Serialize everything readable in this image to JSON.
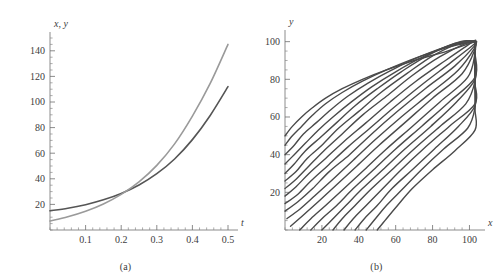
{
  "figure": {
    "panels": [
      {
        "caption": "(a)",
        "ylabel": "x, y",
        "xlabel": "t",
        "xticks": [
          "0.1",
          "0.2",
          "0.3",
          "0.4",
          "0.5"
        ],
        "yticks": [
          "20",
          "40",
          "60",
          "80",
          "100",
          "120",
          "140"
        ]
      },
      {
        "caption": "(b)",
        "ylabel": "y",
        "xlabel": "x",
        "xticks": [
          "20",
          "40",
          "60",
          "80",
          "100"
        ],
        "yticks": [
          "20",
          "40",
          "60",
          "80",
          "100"
        ]
      }
    ]
  },
  "chart_data": [
    {
      "type": "line",
      "panel": "(a)",
      "title": "",
      "xlabel": "t",
      "ylabel": "x, y",
      "xlim": [
        0,
        0.5
      ],
      "ylim": [
        0,
        150
      ],
      "xticks": [
        0.1,
        0.2,
        0.3,
        0.4,
        0.5
      ],
      "yticks": [
        20,
        40,
        60,
        80,
        100,
        120,
        140
      ],
      "grid": false,
      "legend": "none",
      "minor_ticks": true,
      "series": [
        {
          "name": "x(t)",
          "color": "#555555",
          "linewidth": 1.6,
          "x": [
            0,
            0.05,
            0.1,
            0.15,
            0.2,
            0.25,
            0.3,
            0.35,
            0.4,
            0.45,
            0.5
          ],
          "values": [
            15.0,
            17.0,
            19.8,
            23.6,
            28.6,
            35.2,
            44.0,
            55.5,
            70.6,
            89.5,
            112.0
          ]
        },
        {
          "name": "y(t)",
          "color": "#9a9a9a",
          "linewidth": 1.6,
          "x": [
            0,
            0.05,
            0.1,
            0.15,
            0.2,
            0.25,
            0.3,
            0.35,
            0.4,
            0.45,
            0.5
          ],
          "values": [
            7.0,
            10.3,
            14.6,
            20.3,
            27.8,
            37.6,
            50.5,
            67.3,
            89.0,
            114.5,
            145.0
          ]
        }
      ],
      "annotations": [
        {
          "text": "curves cross near t = 0.18",
          "x": 0.18,
          "y": 26
        }
      ]
    },
    {
      "type": "line",
      "panel": "(b)",
      "title": "",
      "xlabel": "x",
      "ylabel": "y",
      "xlim": [
        0,
        103
      ],
      "ylim": [
        0,
        103
      ],
      "xticks": [
        20,
        40,
        60,
        80,
        100
      ],
      "yticks": [
        20,
        40,
        60,
        80,
        100
      ],
      "grid": false,
      "legend": "none",
      "minor_ticks": true,
      "description": "Family of phase-plane trajectories; curves rise steeply from the x-axis then bend to a common oblique direction toward upper right.",
      "family_count": 20,
      "family_param_name": "trajectory",
      "series": [
        {
          "name": "traj-1",
          "color": "#4a4a4a",
          "x": [
            0,
            4,
            9,
            15,
            22,
            31,
            42,
            55,
            70,
            88,
            103
          ],
          "values": [
            50,
            55,
            60,
            65,
            70,
            75,
            80,
            85,
            90,
            95,
            100
          ]
        },
        {
          "name": "traj-2",
          "color": "#4a4a4a",
          "x": [
            0,
            4,
            9,
            15,
            22,
            31,
            42,
            55,
            70,
            88,
            103
          ],
          "values": [
            45,
            50,
            55,
            61,
            67,
            73,
            79,
            85,
            91,
            97,
            100
          ]
        },
        {
          "name": "traj-3",
          "color": "#4a4a4a",
          "x": [
            0,
            5,
            10,
            17,
            25,
            34,
            45,
            58,
            73,
            90,
            103
          ],
          "values": [
            40,
            45,
            51,
            57,
            64,
            71,
            78,
            85,
            92,
            98,
            100
          ]
        },
        {
          "name": "traj-4",
          "color": "#4a4a4a",
          "x": [
            0,
            5,
            11,
            18,
            26,
            36,
            47,
            60,
            75,
            92,
            103
          ],
          "values": [
            35,
            40,
            46,
            53,
            60,
            68,
            76,
            84,
            92,
            99,
            100
          ]
        },
        {
          "name": "traj-5",
          "color": "#4a4a4a",
          "x": [
            0,
            5,
            11,
            19,
            28,
            38,
            50,
            63,
            78,
            95,
            103
          ],
          "values": [
            30,
            35,
            42,
            49,
            57,
            66,
            75,
            84,
            93,
            100,
            100
          ]
        },
        {
          "name": "traj-6",
          "color": "#4a4a4a",
          "x": [
            0,
            6,
            12,
            20,
            29,
            40,
            52,
            66,
            81,
            97,
            103
          ],
          "values": [
            26,
            31,
            38,
            45,
            54,
            63,
            73,
            83,
            93,
            100,
            100
          ]
        },
        {
          "name": "traj-7",
          "color": "#4a4a4a",
          "x": [
            0,
            6,
            13,
            21,
            31,
            42,
            55,
            69,
            84,
            100,
            103
          ],
          "values": [
            22,
            27,
            34,
            42,
            51,
            61,
            71,
            82,
            92,
            100,
            100
          ]
        },
        {
          "name": "traj-8",
          "color": "#4a4a4a",
          "x": [
            0,
            6,
            13,
            22,
            32,
            44,
            57,
            71,
            87,
            102,
            103
          ],
          "values": [
            18,
            23,
            30,
            38,
            47,
            57,
            68,
            79,
            90,
            100,
            100
          ]
        },
        {
          "name": "traj-9",
          "color": "#4a4a4a",
          "x": [
            0,
            7,
            14,
            23,
            34,
            46,
            59,
            74,
            90,
            103,
            103
          ],
          "values": [
            14,
            19,
            26,
            34,
            44,
            54,
            65,
            77,
            89,
            99,
            100
          ]
        },
        {
          "name": "traj-10",
          "color": "#4a4a4a",
          "x": [
            0,
            7,
            15,
            24,
            35,
            47,
            61,
            76,
            92,
            103,
            103
          ],
          "values": [
            10,
            15,
            22,
            31,
            40,
            51,
            63,
            75,
            87,
            98,
            100
          ]
        },
        {
          "name": "traj-11",
          "color": "#4a4a4a",
          "x": [
            1,
            8,
            16,
            26,
            37,
            49,
            63,
            78,
            94,
            103,
            103
          ],
          "values": [
            6,
            11,
            18,
            27,
            37,
            48,
            60,
            72,
            85,
            97,
            100
          ]
        },
        {
          "name": "traj-12",
          "color": "#4a4a4a",
          "x": [
            3,
            10,
            18,
            28,
            39,
            51,
            65,
            80,
            96,
            103,
            103
          ],
          "values": [
            2,
            8,
            15,
            24,
            34,
            45,
            57,
            70,
            83,
            96,
            100
          ]
        },
        {
          "name": "traj-13",
          "color": "#4a4a4a",
          "x": [
            8,
            14,
            22,
            32,
            43,
            55,
            69,
            84,
            99,
            103,
            103
          ],
          "values": [
            0,
            6,
            13,
            22,
            32,
            43,
            55,
            68,
            81,
            94,
            100
          ]
        },
        {
          "name": "traj-14",
          "color": "#4a4a4a",
          "x": [
            14,
            20,
            28,
            37,
            48,
            60,
            74,
            89,
            103,
            103,
            103
          ],
          "values": [
            0,
            6,
            13,
            22,
            32,
            43,
            55,
            68,
            81,
            94,
            100
          ]
        },
        {
          "name": "traj-15",
          "color": "#4a4a4a",
          "x": [
            20,
            26,
            33,
            42,
            53,
            65,
            79,
            93,
            103,
            103,
            103
          ],
          "values": [
            0,
            6,
            13,
            22,
            32,
            43,
            55,
            68,
            80,
            92,
            100
          ]
        },
        {
          "name": "traj-16",
          "color": "#4a4a4a",
          "x": [
            26,
            31,
            38,
            47,
            58,
            70,
            84,
            98,
            103,
            103,
            103
          ],
          "values": [
            0,
            6,
            13,
            22,
            32,
            43,
            55,
            67,
            79,
            90,
            100
          ]
        },
        {
          "name": "traj-17",
          "color": "#4a4a4a",
          "x": [
            32,
            37,
            44,
            53,
            63,
            75,
            89,
            103,
            103,
            103,
            103
          ],
          "values": [
            0,
            6,
            13,
            22,
            32,
            43,
            55,
            67,
            78,
            89,
            100
          ]
        },
        {
          "name": "traj-18",
          "color": "#4a4a4a",
          "x": [
            38,
            43,
            50,
            58,
            69,
            81,
            94,
            103,
            103,
            103,
            103
          ],
          "values": [
            0,
            6,
            13,
            22,
            32,
            43,
            55,
            66,
            77,
            88,
            99
          ]
        },
        {
          "name": "traj-19",
          "color": "#4a4a4a",
          "x": [
            44,
            49,
            55,
            64,
            74,
            86,
            99,
            103,
            103,
            103,
            103
          ],
          "values": [
            0,
            6,
            13,
            22,
            32,
            43,
            54,
            65,
            76,
            87,
            98
          ]
        },
        {
          "name": "traj-20",
          "color": "#4a4a4a",
          "x": [
            50,
            55,
            61,
            69,
            80,
            92,
            103,
            103,
            103,
            103,
            103
          ],
          "values": [
            0,
            6,
            13,
            22,
            32,
            42,
            53,
            64,
            75,
            86,
            95
          ]
        }
      ]
    }
  ]
}
